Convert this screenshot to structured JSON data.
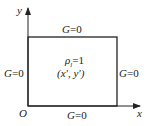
{
  "diagram": {
    "axes": {
      "x_label": "x",
      "y_label": "y",
      "origin_label": "O"
    },
    "boundaries": {
      "top": "G=0",
      "bottom": "G=0",
      "left": "G=0",
      "right": "G=0"
    },
    "source": {
      "density": "ρ",
      "density_sub": "l",
      "density_value": "=1",
      "point": "(x', y')"
    },
    "colors": {
      "line": "#222222",
      "background": "#ffffff"
    }
  }
}
